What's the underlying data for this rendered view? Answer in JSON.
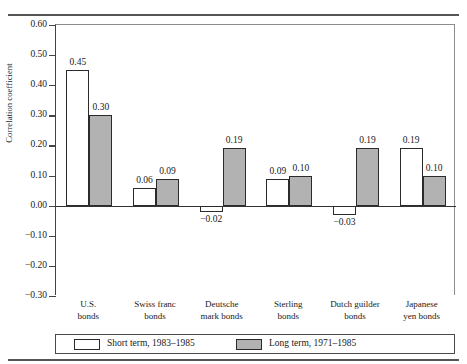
{
  "chart_data": {
    "type": "bar",
    "title": "",
    "subtitle": "",
    "xlabel": "",
    "ylabel": "Correlation coefficient",
    "ylim": [
      -0.3,
      0.6
    ],
    "ytick_interval": 0.1,
    "ytick_labels": [
      "0.60",
      "0.50",
      "0.40",
      "0.30",
      "0.20",
      "0.10",
      "0.00",
      "−0.10",
      "−0.20",
      "−0.30"
    ],
    "ytick_values": [
      0.6,
      0.5,
      0.4,
      0.3,
      0.2,
      0.1,
      0.0,
      -0.1,
      -0.2,
      -0.3
    ],
    "grid": false,
    "legend_position": "bottom",
    "categories": [
      "U.S.\nbonds",
      "Swiss franc\nbonds",
      "Deutsche\nmark bonds",
      "Sterling\nbonds",
      "Dutch guilder\nbonds",
      "Japanese\nyen bonds"
    ],
    "series": [
      {
        "name": "Short term, 1983–1985",
        "color": "#ffffff",
        "values": [
          0.45,
          0.06,
          -0.02,
          0.09,
          -0.03,
          0.19
        ],
        "labels": [
          "0.45",
          "0.06",
          "−0.02",
          "0.09",
          "−0.03",
          "0.19"
        ]
      },
      {
        "name": "Long term, 1971–1985",
        "color": "#b2b2b2",
        "values": [
          0.3,
          0.09,
          0.19,
          0.1,
          0.19,
          0.1
        ],
        "labels": [
          "0.30",
          "0.09",
          "0.19",
          "0.10",
          "0.19",
          "0.10"
        ]
      }
    ]
  },
  "legend": {
    "items": [
      {
        "label": "Short term, 1983–1985",
        "swatch": "white"
      },
      {
        "label": "Long term, 1971–1985",
        "swatch": "gray"
      }
    ]
  }
}
